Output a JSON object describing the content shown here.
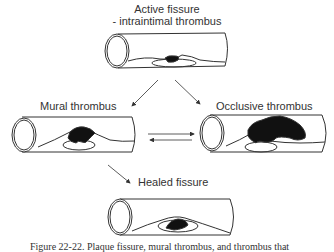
{
  "figure": {
    "stages": [
      {
        "id": "active",
        "label_line1": "Active fissure",
        "label_line2": "- intraintimal thrombus"
      },
      {
        "id": "mural",
        "label": "Mural thrombus"
      },
      {
        "id": "occlusive",
        "label": "Occlusive thrombus"
      },
      {
        "id": "healed",
        "label": "Healed fissure"
      }
    ],
    "caption": "Figure 22-22. Plaque fissure, mural thrombus, and thrombus that"
  }
}
